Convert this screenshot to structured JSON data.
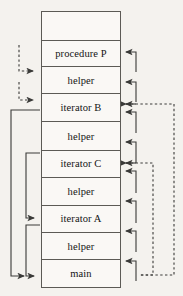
{
  "diagram": {
    "colors": {
      "background": "#f4f2ee",
      "frame_fill": "#faf8f5",
      "stroke": "#5c5a55",
      "arrow": "#3a3a38",
      "text": "#141414"
    },
    "stack": {
      "label": "call-stack",
      "frames": [
        {
          "label": "",
          "kind": "empty",
          "height": 29
        },
        {
          "label": "procedure P",
          "kind": "procedure",
          "height": 28
        },
        {
          "label": "helper",
          "kind": "helper",
          "height": 28
        },
        {
          "label": "iterator B",
          "kind": "iterator",
          "height": 30
        },
        {
          "label": "helper",
          "kind": "helper",
          "height": 30
        },
        {
          "label": "iterator C",
          "kind": "iterator",
          "height": 28
        },
        {
          "label": "helper",
          "kind": "helper",
          "height": 30
        },
        {
          "label": "iterator A",
          "kind": "iterator",
          "height": 28
        },
        {
          "label": "helper",
          "kind": "helper",
          "height": 29
        },
        {
          "label": "main",
          "kind": "main",
          "height": 29
        }
      ]
    },
    "connectors": {
      "right_return_hooks": [
        {
          "name": "return-hook-procedure-p",
          "style": "solid"
        },
        {
          "name": "return-hook-helper-1",
          "style": "solid"
        },
        {
          "name": "return-hook-iterator-b-in",
          "style": "solid"
        },
        {
          "name": "return-hook-iterator-b-out",
          "style": "solid"
        },
        {
          "name": "return-hook-helper-2",
          "style": "solid"
        },
        {
          "name": "return-hook-iterator-c-in",
          "style": "solid"
        },
        {
          "name": "return-hook-iterator-c-out",
          "style": "solid"
        },
        {
          "name": "return-hook-helper-3",
          "style": "solid"
        },
        {
          "name": "return-hook-iterator-a",
          "style": "solid"
        },
        {
          "name": "return-hook-helper-4",
          "style": "solid"
        }
      ],
      "right_dashed_links": [
        {
          "name": "dashed-link-iterator-b-to-main",
          "style": "dashed"
        },
        {
          "name": "dashed-link-iterator-c-to-main",
          "style": "dashed"
        }
      ],
      "left_dashed_hooks": [
        {
          "name": "dashed-hook-to-helper-1",
          "style": "dashed"
        },
        {
          "name": "dashed-hook-to-iterator-b",
          "style": "dashed"
        }
      ],
      "left_solid_brackets": [
        {
          "name": "bracket-iterator-b-to-main",
          "style": "solid"
        },
        {
          "name": "bracket-iterator-c-to-iterator-a",
          "style": "solid"
        },
        {
          "name": "bracket-iterator-a-to-main",
          "style": "solid"
        }
      ]
    }
  }
}
